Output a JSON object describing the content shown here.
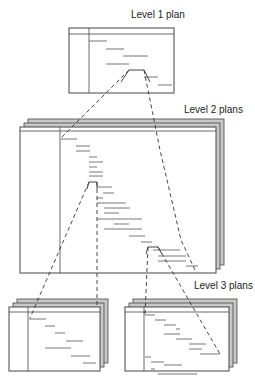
{
  "labels": {
    "level1": "Level 1 plan",
    "level2": "Level 2 plans",
    "level3": "Level 3 plans"
  },
  "colors": {
    "frame": "#444444",
    "backSheet": "#c8c8c8",
    "bar": "#666666",
    "dash": "#333333"
  },
  "sheets": [
    {
      "id": "level1",
      "x": 69,
      "y": 28,
      "w": 105,
      "h": 65,
      "divider": 89,
      "header": 34,
      "stack": 0
    },
    {
      "id": "level2",
      "x": 20,
      "y": 127,
      "w": 196,
      "h": 146,
      "divider": 60,
      "header": 131,
      "stack": 2
    },
    {
      "id": "level3-left",
      "x": 9,
      "y": 307,
      "w": 91,
      "h": 64,
      "divider": 28,
      "header": 312,
      "stack": 2
    },
    {
      "id": "level3-right",
      "x": 125,
      "y": 307,
      "w": 104,
      "h": 64,
      "divider": 144,
      "header": 312,
      "stack": 2
    }
  ],
  "bars": {
    "level1": [
      [
        89,
        107,
        41
      ],
      [
        106,
        124,
        49
      ],
      [
        123,
        148,
        56
      ],
      [
        106,
        129,
        64
      ],
      [
        144,
        158,
        77
      ],
      [
        158,
        172,
        85
      ]
    ],
    "level2": [
      [
        61,
        77,
        139
      ],
      [
        76,
        90,
        146
      ],
      [
        76,
        90,
        151
      ],
      [
        89,
        97,
        157
      ],
      [
        89,
        103,
        162
      ],
      [
        89,
        97,
        167
      ],
      [
        89,
        103,
        172
      ],
      [
        89,
        103,
        176
      ],
      [
        97,
        112,
        187
      ],
      [
        103,
        114,
        193
      ],
      [
        97,
        103,
        198
      ],
      [
        97,
        126,
        203
      ],
      [
        104,
        130,
        208
      ],
      [
        104,
        119,
        213
      ],
      [
        97,
        142,
        219
      ],
      [
        114,
        129,
        224
      ],
      [
        104,
        142,
        229
      ],
      [
        129,
        145,
        236
      ],
      [
        141,
        152,
        242
      ],
      [
        153,
        180,
        250
      ],
      [
        158,
        186,
        256
      ],
      [
        158,
        186,
        261
      ],
      [
        186,
        198,
        266
      ]
    ],
    "level3-left": [
      [
        29,
        46,
        319
      ],
      [
        45,
        55,
        326
      ],
      [
        55,
        65,
        333
      ],
      [
        66,
        83,
        341
      ],
      [
        45,
        71,
        348
      ],
      [
        71,
        90,
        356
      ],
      [
        83,
        96,
        363
      ]
    ],
    "level3-right": [
      [
        145,
        155,
        315
      ],
      [
        155,
        166,
        320
      ],
      [
        164,
        176,
        325
      ],
      [
        176,
        180,
        329
      ],
      [
        164,
        180,
        334
      ],
      [
        176,
        192,
        339
      ],
      [
        189,
        206,
        344
      ],
      [
        189,
        202,
        349
      ],
      [
        200,
        220,
        354
      ],
      [
        145,
        151,
        357
      ],
      [
        151,
        164,
        362
      ],
      [
        164,
        182,
        365
      ],
      [
        151,
        155,
        369
      ],
      [
        158,
        197,
        374
      ]
    ]
  },
  "trapezoids": [
    {
      "sheet": "level1",
      "pts": "121,82 129,70 144,70 150,82"
    },
    {
      "sheet": "level2",
      "pts": "87,189 89,182 97,182 97,189"
    },
    {
      "sheet": "level2",
      "pts": "146,254 148,247 158,247 162,254"
    }
  ],
  "zoomLines": [
    [
      [
        129,
        70
      ],
      [
        61,
        138
      ]
    ],
    [
      [
        144,
        70
      ],
      [
        160,
        150
      ],
      [
        181,
        240
      ],
      [
        196,
        272
      ]
    ],
    [
      [
        89,
        182
      ],
      [
        30,
        318
      ]
    ],
    [
      [
        97,
        182
      ],
      [
        97,
        250
      ],
      [
        97,
        306
      ]
    ],
    [
      [
        148,
        247
      ],
      [
        145,
        315
      ]
    ],
    [
      [
        158,
        247
      ],
      [
        220,
        354
      ]
    ]
  ]
}
